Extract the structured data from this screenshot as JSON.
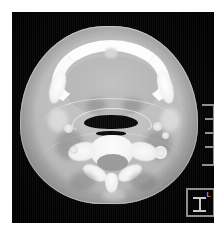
{
  "viewer": {
    "background_color": "#ffffff",
    "image_field_color": "#050505"
  },
  "scan": {
    "modality": "CT",
    "plane": "axial",
    "region": "neck",
    "level": "larynx / cervical spine",
    "description": "Axial CT slice through the neck showing mandible, tongue, airway and cervical vertebra"
  },
  "overlays": {
    "scale_bar": {
      "name": "scale-bar",
      "orientation": "vertical",
      "tick_count": 5,
      "color": "#8f8f8f"
    },
    "orientation_marker": {
      "name": "orientation-marker",
      "axis_label": "I",
      "side_label": "L",
      "border_color": "#8d8d8d",
      "glyph_color": "#c8c8c8"
    }
  },
  "anatomy": {
    "structures": [
      {
        "name": "skin-envelope",
        "label": "Skin / subcutaneous fat"
      },
      {
        "name": "mandible",
        "label": "Mandible"
      },
      {
        "name": "tongue",
        "label": "Tongue / floor of mouth"
      },
      {
        "name": "airway",
        "label": "Airway (larynx)"
      },
      {
        "name": "vertebral-body",
        "label": "Cervical vertebral body"
      },
      {
        "name": "spinal-canal",
        "label": "Spinal canal"
      },
      {
        "name": "spinous-process",
        "label": "Spinous process"
      },
      {
        "name": "vessel",
        "label": "Carotid / jugular vessel"
      }
    ]
  }
}
